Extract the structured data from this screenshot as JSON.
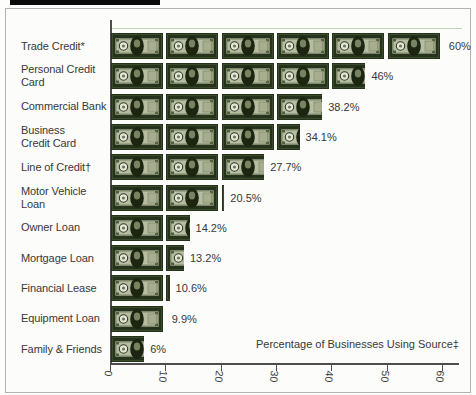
{
  "figure": {
    "x_axis_title": "Percentage of Businesses Using Source‡",
    "x_tick_labels": [
      "0",
      "10",
      "20",
      "30",
      "40",
      "50",
      "60"
    ]
  },
  "chart_data": {
    "type": "bar",
    "orientation": "horizontal",
    "pictogram_note": "each dollar-bill symbol represents 10 percentage points",
    "categories": [
      "Trade Credit*",
      "Personal Credit Card",
      "Commercial Bank",
      "Business\nCredit Card",
      "Line of Credit†",
      "Motor Vehicle Loan",
      "Owner Loan",
      "Mortgage Loan",
      "Financial Lease",
      "Equipment Loan",
      "Family & Friends"
    ],
    "values": [
      60,
      46,
      38.2,
      34.1,
      27.7,
      20.5,
      14.2,
      13.2,
      10.6,
      9.9,
      6
    ],
    "value_labels": [
      "60%",
      "46%",
      "38.2%",
      "34.1%",
      "27.7%",
      "20.5%",
      "14.2%",
      "13.2%",
      "10.6%",
      "9.9%",
      "6%"
    ],
    "xlabel": "Percentage of Businesses Using Source‡",
    "xlim": [
      0,
      60
    ],
    "x_ticks": [
      0,
      10,
      20,
      30,
      40,
      50,
      60
    ],
    "grid": false,
    "legend": false
  },
  "colors": {
    "bill_frame": "#26331c",
    "bill_frame_inner_stroke": "#3c4a2c",
    "bill_field": "#b6bda3",
    "bill_field_stroke": "#2c3820",
    "bill_engraving": "#879070",
    "bill_seal": "#e4e6d8",
    "bill_seal_stroke": "#2e3a20",
    "bill_seal_dot": "#6c765a",
    "bill_portrait": "#1b2510",
    "bill_face": "#8a9370",
    "bill_right_seal": "#a7ae90",
    "bill_right_seal_stroke": "#79815f",
    "bill_corner_mark": "#525f3e",
    "axis": "#4d4d4d",
    "text": "#383838",
    "figure_border": "#b2b2b2",
    "top_bar": "#0a0a0a",
    "hairline_green": "#a9c89b"
  }
}
